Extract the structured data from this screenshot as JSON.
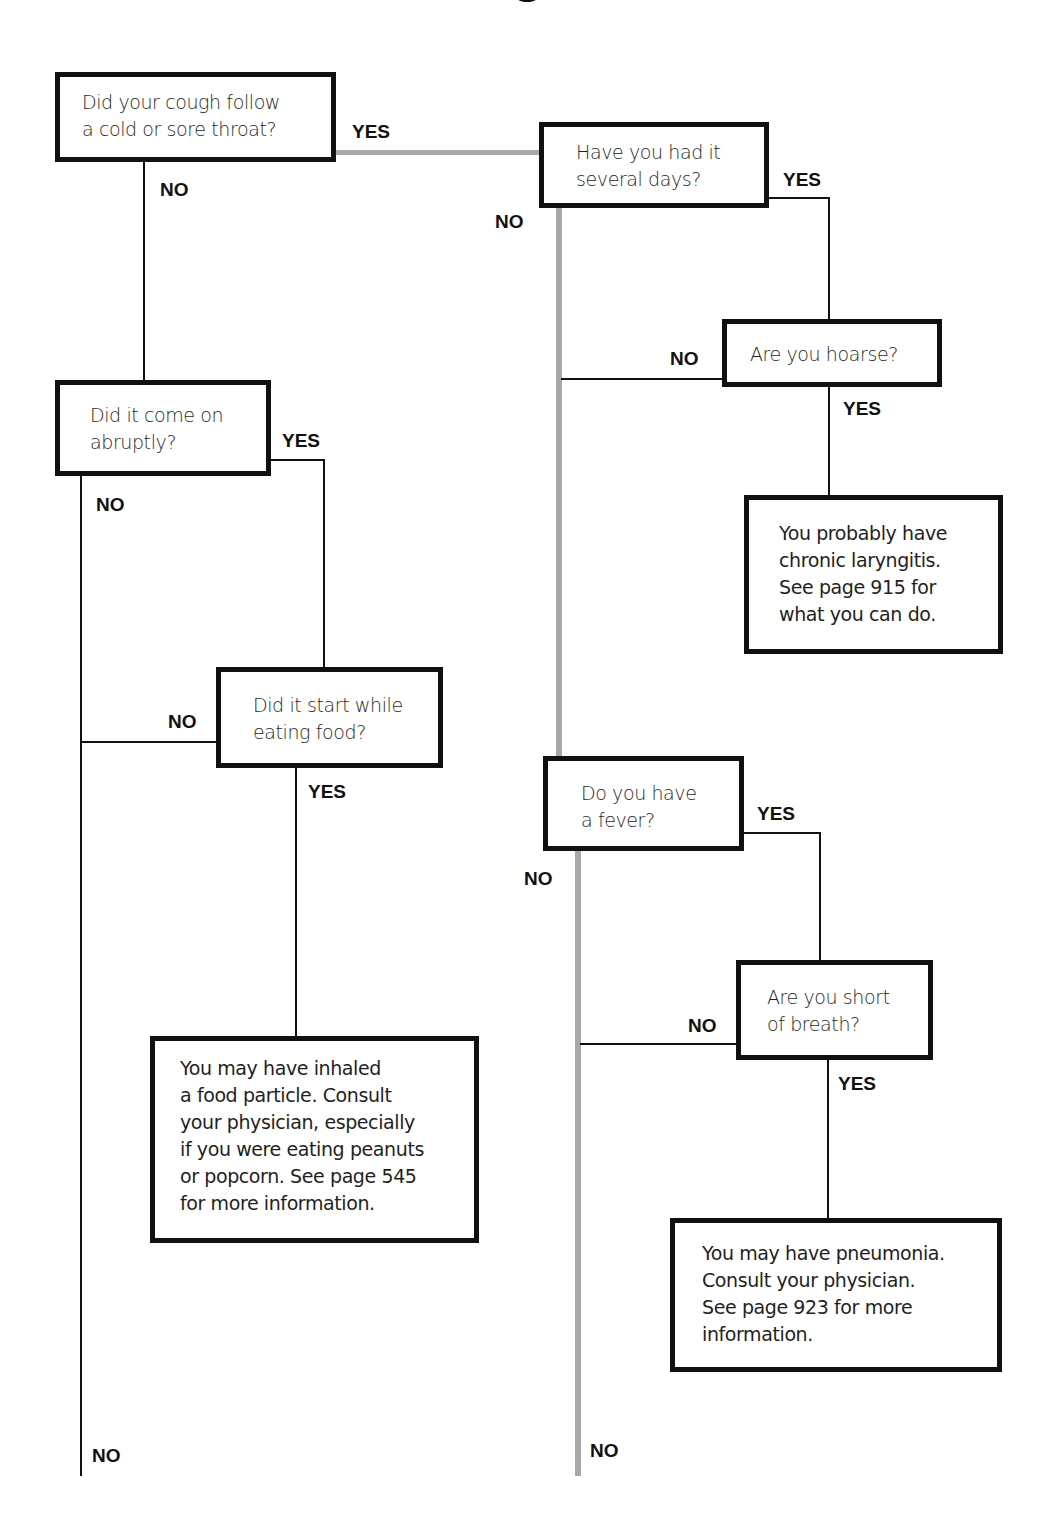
{
  "title_fragment": "g",
  "colors": {
    "line": "#111111",
    "main_path": "#a8a8a8",
    "box_border": "#111111"
  },
  "nodes": {
    "q1": {
      "text": "Did your cough follow\na cold or sore throat?"
    },
    "q2": {
      "text": "Have you had it\nseveral days?"
    },
    "q3": {
      "text": "Are you hoarse?"
    },
    "a1": {
      "text": "You probably have\nchronic laryngitis.\nSee page 915 for\nwhat you can do."
    },
    "q4": {
      "text": "Did it come on\nabruptly?"
    },
    "q5": {
      "text": "Did it start while\neating food?"
    },
    "a2": {
      "text": "You may have inhaled\na food particle. Consult\nyour physician, especially\nif you were eating peanuts\nor popcorn. See page 545\nfor more information."
    },
    "q6": {
      "text": "Do you have\na fever?"
    },
    "q7": {
      "text": "Are you short\nof breath?"
    },
    "a3": {
      "text": "You may have pneumonia.\nConsult your physician.\nSee page 923 for more\ninformation."
    }
  },
  "labels": {
    "q1_yes": "YES",
    "q1_no": "NO",
    "q2_yes": "YES",
    "q2_no": "NO",
    "q3_no": "NO",
    "q3_yes": "YES",
    "q4_yes": "YES",
    "q4_no": "NO",
    "q5_no": "NO",
    "q5_yes": "YES",
    "q6_yes": "YES",
    "q6_no": "NO",
    "q7_no": "NO",
    "q7_yes": "YES",
    "left_end_no": "NO",
    "right_end_no": "NO"
  }
}
